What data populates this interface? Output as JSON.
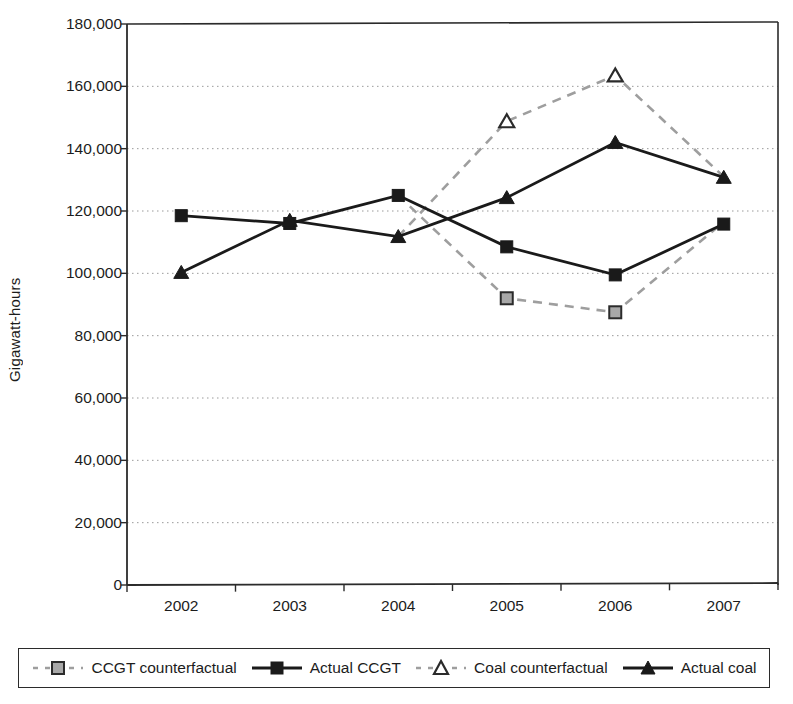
{
  "chart_data": {
    "type": "line",
    "title": "",
    "xlabel": "",
    "ylabel": "Gigawatt-hours",
    "categories": [
      "2002",
      "2003",
      "2004",
      "2005",
      "2006",
      "2007"
    ],
    "ylim": [
      0,
      180000
    ],
    "ytick_step": 20000,
    "ytick_labels": [
      "180,000",
      "160,000",
      "140,000",
      "120,000",
      "100,000",
      "80,000",
      "60,000",
      "40,000",
      "20,000",
      "0"
    ],
    "ytick_values": [
      180000,
      160000,
      140000,
      120000,
      100000,
      80000,
      60000,
      40000,
      20000,
      0
    ],
    "grid": true,
    "grid_style": "dotted-horizontal",
    "legend_position": "bottom",
    "series": [
      {
        "name": "CCGT counterfactual",
        "style": "dashed",
        "marker": "square-gray",
        "color": "#8c8c8c",
        "x": [
          "2005",
          "2006",
          "2007"
        ],
        "values": [
          92000,
          87500,
          116500
        ]
      },
      {
        "name": "Actual CCGT",
        "style": "solid",
        "marker": "square-filled",
        "color": "#1a1a1a",
        "x": [
          "2002",
          "2003",
          "2004",
          "2005",
          "2006",
          "2007"
        ],
        "values": [
          118500,
          116000,
          125000,
          108500,
          99500,
          115800
        ]
      },
      {
        "name": "Coal counterfactual",
        "style": "dashed",
        "marker": "triangle-open",
        "color": "#8c8c8c",
        "x": [
          "2005",
          "2006",
          "2007"
        ],
        "values": [
          148800,
          163500,
          131000
        ]
      },
      {
        "name": "Actual coal",
        "style": "solid",
        "marker": "triangle-filled",
        "color": "#1a1a1a",
        "x": [
          "2002",
          "2003",
          "2004",
          "2005",
          "2006",
          "2007"
        ],
        "values": [
          100300,
          117000,
          111800,
          124300,
          142000,
          130800
        ]
      }
    ],
    "counterfactual_branch_note": "counterfactual dashed series branch from the actual series at 2004 and rejoin at 2007"
  },
  "legend": {
    "items": [
      {
        "label": "CCGT counterfactual",
        "marker": "square-gray-dashed-icon"
      },
      {
        "label": "Actual CCGT",
        "marker": "square-filled-solid-icon"
      },
      {
        "label": "Coal counterfactual",
        "marker": "triangle-open-dashed-icon"
      },
      {
        "label": "Actual coal",
        "marker": "triangle-filled-solid-icon"
      }
    ]
  },
  "colors": {
    "axis": "#2b2b2b",
    "grid": "#9a9a9a",
    "actual": "#1a1a1a",
    "counterfactual": "#8c8c8c",
    "background": "#ffffff"
  }
}
